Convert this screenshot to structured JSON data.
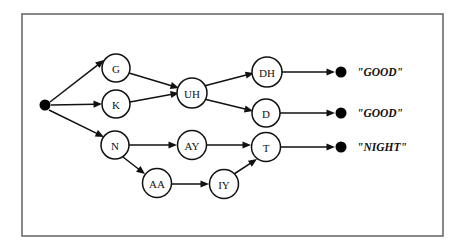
{
  "diagram": {
    "frame": {
      "x": 22,
      "y": 14,
      "width": 421,
      "height": 222,
      "stroke_color": "#6b6b6b"
    },
    "colors": {
      "node_stroke": "#111111",
      "node_fill": "#ffffff",
      "edge": "#111111",
      "dot": "#000000",
      "background": "#ffffff"
    },
    "start_node": {
      "name": "start-dot",
      "cx": 45,
      "cy": 105,
      "r": 5.5
    },
    "nodes": [
      {
        "id": "G",
        "label": "G",
        "cx": 116,
        "cy": 68,
        "r": 14
      },
      {
        "id": "K",
        "label": "K",
        "cx": 116,
        "cy": 104,
        "r": 14
      },
      {
        "id": "N",
        "label": "N",
        "cx": 115,
        "cy": 145,
        "r": 14
      },
      {
        "id": "UH",
        "label": "UH",
        "cx": 192,
        "cy": 93,
        "r": 15
      },
      {
        "id": "AY",
        "label": "AY",
        "cx": 192,
        "cy": 145,
        "r": 14.5
      },
      {
        "id": "AA",
        "label": "AA",
        "cx": 157,
        "cy": 183,
        "r": 14.5
      },
      {
        "id": "IY",
        "label": "IY",
        "cx": 224,
        "cy": 184,
        "r": 14.5
      },
      {
        "id": "DH",
        "label": "DH",
        "cx": 267,
        "cy": 72,
        "r": 15
      },
      {
        "id": "D",
        "label": "D",
        "cx": 266,
        "cy": 113,
        "r": 14
      },
      {
        "id": "T",
        "label": "T",
        "cx": 266,
        "cy": 147,
        "r": 14.5
      }
    ],
    "terminals": [
      {
        "id": "end-good-1",
        "cx": 341,
        "cy": 72,
        "r": 5.5,
        "word": "\"GOOD\"",
        "label_x": 357,
        "label_y": 72
      },
      {
        "id": "end-good-2",
        "cx": 341,
        "cy": 113,
        "r": 5.5,
        "word": "\"GOOD\"",
        "label_x": 357,
        "label_y": 113
      },
      {
        "id": "end-night",
        "cx": 341,
        "cy": 147,
        "r": 5.5,
        "word": "\"NIGHT\"",
        "label_x": 357,
        "label_y": 147
      }
    ],
    "edges": [
      {
        "id": "start-to-G",
        "from": "start",
        "to": "G",
        "x1": 50,
        "y1": 102,
        "x2": 104,
        "y2": 60
      },
      {
        "id": "start-to-K",
        "from": "start",
        "to": "K",
        "x1": 51,
        "y1": 105,
        "x2": 102,
        "y2": 104
      },
      {
        "id": "start-to-N",
        "from": "start",
        "to": "N",
        "x1": 49,
        "y1": 110,
        "x2": 104,
        "y2": 137
      },
      {
        "id": "G-to-UH",
        "from": "G",
        "to": "UH",
        "x1": 129,
        "y1": 73,
        "x2": 179,
        "y2": 88
      },
      {
        "id": "K-to-UH",
        "from": "K",
        "to": "UH",
        "x1": 130,
        "y1": 102,
        "x2": 179,
        "y2": 93
      },
      {
        "id": "UH-to-DH",
        "from": "UH",
        "to": "DH",
        "x1": 204,
        "y1": 86,
        "x2": 254,
        "y2": 73
      },
      {
        "id": "UH-to-D",
        "from": "UH",
        "to": "D",
        "x1": 204,
        "y1": 99,
        "x2": 253,
        "y2": 111
      },
      {
        "id": "DH-to-end1",
        "from": "DH",
        "to": "end-good-1",
        "x1": 282,
        "y1": 72,
        "x2": 335,
        "y2": 72
      },
      {
        "id": "D-to-end2",
        "from": "D",
        "to": "end-good-2",
        "x1": 280,
        "y1": 113,
        "x2": 335,
        "y2": 113
      },
      {
        "id": "N-to-AY",
        "from": "N",
        "to": "AY",
        "x1": 129,
        "y1": 145,
        "x2": 177,
        "y2": 145
      },
      {
        "id": "N-to-AA",
        "from": "N",
        "to": "AA",
        "x1": 123,
        "y1": 157,
        "x2": 145,
        "y2": 174
      },
      {
        "id": "AA-to-IY",
        "from": "AA",
        "to": "IY",
        "x1": 172,
        "y1": 184,
        "x2": 209,
        "y2": 184
      },
      {
        "id": "AY-to-T",
        "from": "AY",
        "to": "T",
        "x1": 207,
        "y1": 145,
        "x2": 251,
        "y2": 145
      },
      {
        "id": "IY-to-T",
        "from": "IY",
        "to": "T",
        "x1": 234,
        "y1": 174,
        "x2": 257,
        "y2": 159
      },
      {
        "id": "T-to-end3",
        "from": "T",
        "to": "end-night",
        "x1": 281,
        "y1": 147,
        "x2": 335,
        "y2": 147
      }
    ]
  }
}
